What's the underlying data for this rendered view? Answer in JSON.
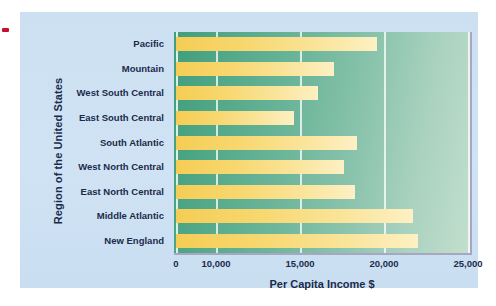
{
  "figure": {
    "panel_background": "#cfe2f3",
    "plot_gradient_start": "#3f9e7d",
    "plot_gradient_end": "#c3dfcd",
    "bar_color": "#f5cd55",
    "bar_color_light": "#fdf0c3",
    "axis_text_color": "#1b2b4a",
    "marker_color": "#c8102e"
  },
  "chart_data": {
    "type": "bar",
    "orientation": "horizontal",
    "title": "",
    "xlabel": "Per Capita Income $",
    "ylabel": "Region of the United States",
    "categories": [
      "Pacific",
      "Mountain",
      "West South Central",
      "East South Central",
      "South Atlantic",
      "West North Central",
      "East North Central",
      "Middle Atlantic",
      "New England"
    ],
    "values": [
      19600,
      17000,
      16100,
      14650,
      18400,
      17600,
      18300,
      21700,
      22000
    ],
    "xlim": [
      0,
      25000
    ],
    "xticks": [
      0,
      10000,
      15000,
      20000,
      25000
    ],
    "xtick_labels": [
      "0",
      "10,000",
      "15,000",
      "20,000",
      "25,000"
    ],
    "grid": true,
    "legend": false
  }
}
